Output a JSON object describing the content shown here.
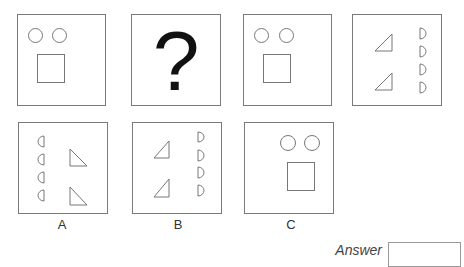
{
  "puzzle": {
    "question_row": [
      {
        "id": "panel-1",
        "content": "two circles above a square (left-aligned)"
      },
      {
        "id": "panel-2",
        "content": "question mark",
        "symbol": "?"
      },
      {
        "id": "panel-3",
        "content": "two circles above a square (left-aligned)"
      },
      {
        "id": "panel-4",
        "content": "two triangles (right angle bottom-right) left, four D half-circles right"
      }
    ],
    "options": [
      {
        "label": "A",
        "content": "four reversed half-circles left, two triangles (right angle bottom-left) right"
      },
      {
        "label": "B",
        "content": "two triangles (right angle bottom-right) left, four D half-circles right"
      },
      {
        "label": "C",
        "content": "two circles above a square (right-shifted)"
      }
    ]
  },
  "answer": {
    "label": "Answer",
    "value": ""
  },
  "colors": {
    "border": "#7a7a7a",
    "stroke": "#777777",
    "text": "#333333"
  }
}
